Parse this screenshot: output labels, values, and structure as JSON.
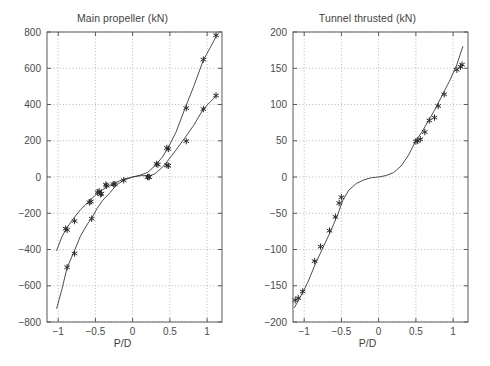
{
  "figure": {
    "background": "#ffffff",
    "axis_color": "#5a5a5a",
    "grid_color": "#9a9a9a",
    "curve_color": "#3a3a3a",
    "marker_color": "#2b2b2b",
    "panel_count": 2
  },
  "chart_data": [
    {
      "type": "scatter",
      "title": "Main propeller (kN)",
      "xlabel": "P/D",
      "ylabel": "",
      "xlim": [
        -1.15,
        1.2
      ],
      "ylim": [
        -800,
        800
      ],
      "xticks": [
        -1,
        -0.5,
        0,
        0.5,
        1
      ],
      "xticklabels": [
        "-1",
        "-0.5",
        "0",
        "0.5",
        "1"
      ],
      "yticks": [
        -800,
        -600,
        -400,
        -200,
        0,
        200,
        400,
        600,
        800
      ],
      "yticklabels": [
        "-800",
        "-600",
        "-400",
        "-200",
        "0",
        "200",
        "400",
        "600",
        "800"
      ],
      "grid": true,
      "legend": "none",
      "series": [
        {
          "name": "upper-branch-fit",
          "kind": "line",
          "points": [
            [
              -1.02,
              -405
            ],
            [
              -0.95,
              -330
            ],
            [
              -0.88,
              -278
            ],
            [
              -0.8,
              -232
            ],
            [
              -0.7,
              -180
            ],
            [
              -0.6,
              -140
            ],
            [
              -0.5,
              -100
            ],
            [
              -0.4,
              -70
            ],
            [
              -0.3,
              -45
            ],
            [
              -0.2,
              -25
            ],
            [
              -0.1,
              -10
            ],
            [
              0.0,
              0
            ],
            [
              0.1,
              10
            ],
            [
              0.2,
              25
            ],
            [
              0.3,
              62
            ],
            [
              0.4,
              110
            ],
            [
              0.48,
              165
            ],
            [
              0.58,
              245
            ],
            [
              0.7,
              375
            ],
            [
              0.82,
              500
            ],
            [
              0.95,
              645
            ],
            [
              1.05,
              720
            ],
            [
              1.13,
              782
            ]
          ]
        },
        {
          "name": "lower-branch-fit",
          "kind": "line",
          "points": [
            [
              -1.02,
              -725
            ],
            [
              -0.95,
              -620
            ],
            [
              -0.88,
              -500
            ],
            [
              -0.8,
              -425
            ],
            [
              -0.7,
              -325
            ],
            [
              -0.6,
              -255
            ],
            [
              -0.55,
              -228
            ],
            [
              -0.48,
              -175
            ],
            [
              -0.4,
              -128
            ],
            [
              -0.3,
              -85
            ],
            [
              -0.22,
              -45
            ],
            [
              -0.12,
              -18
            ],
            [
              0.0,
              0
            ],
            [
              0.12,
              8
            ],
            [
              0.22,
              5
            ],
            [
              0.3,
              18
            ],
            [
              0.42,
              62
            ],
            [
              0.5,
              105
            ],
            [
              0.58,
              148
            ],
            [
              0.7,
              215
            ],
            [
              0.82,
              285
            ],
            [
              0.95,
              375
            ],
            [
              1.05,
              418
            ],
            [
              1.13,
              450
            ]
          ]
        },
        {
          "name": "measured-upper",
          "kind": "markers",
          "marker": "asterisk",
          "points": [
            [
              -0.9,
              -285
            ],
            [
              -0.88,
              -292
            ],
            [
              -0.78,
              -243
            ],
            [
              -0.58,
              -140
            ],
            [
              -0.56,
              -135
            ],
            [
              -0.47,
              -85
            ],
            [
              -0.45,
              -78
            ],
            [
              -0.42,
              -92
            ],
            [
              -0.36,
              -42
            ],
            [
              -0.24,
              -40
            ],
            [
              0.2,
              0
            ],
            [
              0.22,
              0
            ],
            [
              0.32,
              72
            ],
            [
              0.34,
              68
            ],
            [
              0.46,
              160
            ],
            [
              0.48,
              155
            ],
            [
              0.72,
              380
            ],
            [
              0.95,
              648
            ],
            [
              1.12,
              782
            ]
          ]
        },
        {
          "name": "measured-lower",
          "kind": "markers",
          "marker": "asterisk",
          "points": [
            [
              -0.88,
              -498
            ],
            [
              -0.78,
              -422
            ],
            [
              -0.55,
              -230
            ],
            [
              -0.43,
              -95
            ],
            [
              -0.35,
              -48
            ],
            [
              -0.26,
              -40
            ],
            [
              -0.12,
              -18
            ],
            [
              0.22,
              0
            ],
            [
              0.46,
              65
            ],
            [
              0.48,
              62
            ],
            [
              0.72,
              198
            ],
            [
              0.95,
              375
            ],
            [
              1.12,
              450
            ]
          ]
        }
      ]
    },
    {
      "type": "scatter",
      "title": "Tunnel thrusted (kN)",
      "xlabel": "P/D",
      "ylabel": "",
      "xlim": [
        -1.15,
        1.2
      ],
      "ylim": [
        -200,
        200
      ],
      "xticks": [
        -1,
        -0.5,
        0,
        0.5,
        1
      ],
      "xticklabels": [
        "-1",
        "-0.5",
        "0",
        "0.5",
        "1"
      ],
      "yticks": [
        -200,
        -150,
        -100,
        -50,
        0,
        50,
        100,
        150,
        200
      ],
      "yticklabels": [
        "-200",
        "-150",
        "-100",
        "-50",
        "0",
        "50",
        "100",
        "150",
        "200"
      ],
      "grid": true,
      "legend": "none",
      "series": [
        {
          "name": "fit-curve",
          "kind": "line",
          "points": [
            [
              -1.13,
              -180
            ],
            [
              -1.05,
              -165
            ],
            [
              -0.95,
              -145
            ],
            [
              -0.85,
              -120
            ],
            [
              -0.75,
              -98
            ],
            [
              -0.65,
              -76
            ],
            [
              -0.55,
              -52
            ],
            [
              -0.48,
              -32
            ],
            [
              -0.4,
              -18
            ],
            [
              -0.3,
              -9
            ],
            [
              -0.2,
              -4
            ],
            [
              -0.1,
              -1
            ],
            [
              0.0,
              0
            ],
            [
              0.1,
              2
            ],
            [
              0.2,
              6
            ],
            [
              0.3,
              15
            ],
            [
              0.4,
              30
            ],
            [
              0.5,
              50
            ],
            [
              0.58,
              62
            ],
            [
              0.66,
              76
            ],
            [
              0.75,
              92
            ],
            [
              0.85,
              112
            ],
            [
              0.95,
              132
            ],
            [
              1.05,
              155
            ],
            [
              1.13,
              180
            ]
          ]
        },
        {
          "name": "measured",
          "kind": "markers",
          "marker": "asterisk",
          "points": [
            [
              -1.12,
              -170
            ],
            [
              -1.08,
              -167
            ],
            [
              -1.02,
              -158
            ],
            [
              -0.86,
              -116
            ],
            [
              -0.78,
              -96
            ],
            [
              -0.66,
              -74
            ],
            [
              -0.58,
              -55
            ],
            [
              -0.53,
              -36
            ],
            [
              -0.5,
              -28
            ],
            [
              0.5,
              49
            ],
            [
              0.52,
              50
            ],
            [
              0.56,
              52
            ],
            [
              0.62,
              62
            ],
            [
              0.68,
              78
            ],
            [
              0.75,
              82
            ],
            [
              0.8,
              98
            ],
            [
              0.88,
              114
            ],
            [
              1.05,
              148
            ],
            [
              1.1,
              152
            ],
            [
              1.12,
              155
            ]
          ]
        }
      ]
    }
  ]
}
